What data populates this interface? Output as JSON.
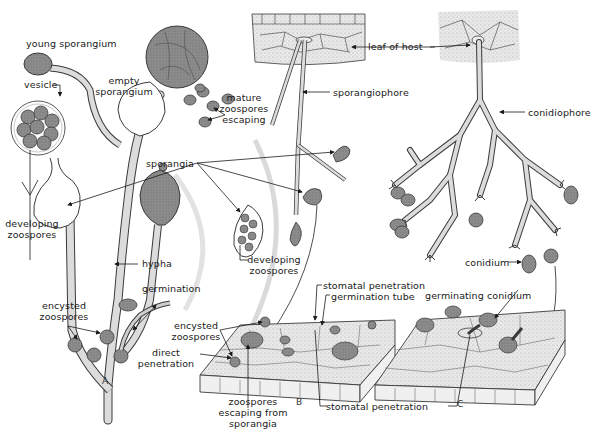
{
  "diagram": {
    "panels": [
      "A",
      "B",
      "C"
    ],
    "colors": {
      "spore_fill": "#8a8a8a",
      "spore_dark": "#6f6f6f",
      "hypha_fill": "#dcdcdc",
      "tissue_fill": "#e6e6e6",
      "outline": "#3a3a3a",
      "guide_arc": "#d8d8d8"
    },
    "labels": {
      "young_sporangium": "young sporangium",
      "vesicle": "vesicle",
      "empty_sporangium_1": "empty",
      "empty_sporangium_2": "sporangium",
      "mature_zoospores_1": "mature",
      "mature_zoospores_2": "zoospores",
      "mature_zoospores_3": "escaping",
      "leaf_of_host": "leaf of host",
      "sporangiophore": "sporangiophore",
      "conidiophore": "conidiophore",
      "sporangia": "sporangia",
      "developing_zoospores_a_1": "developing",
      "developing_zoospores_a_2": "zoospores",
      "developing_zoospores_b_1": "developing",
      "developing_zoospores_b_2": "zoospores",
      "hypha": "hypha",
      "germination": "germination",
      "encysted_zoospores_a_1": "encysted",
      "encysted_zoospores_a_2": "zoospores",
      "encysted_zoospores_b_1": "encysted",
      "encysted_zoospores_b_2": "zoospores",
      "direct_penetration_1": "direct",
      "direct_penetration_2": "penetration",
      "stomatal_penetration_top": "stomatal penetration",
      "germination_tube": "germination tube",
      "germinating_conidium": "germinating conidium",
      "conidium": "conidium",
      "zoospores_escaping_1": "zoospores",
      "zoospores_escaping_2": "escaping from",
      "zoospores_escaping_3": "sporangia",
      "stomatal_penetration_bottom": "stomatal penetration"
    }
  }
}
